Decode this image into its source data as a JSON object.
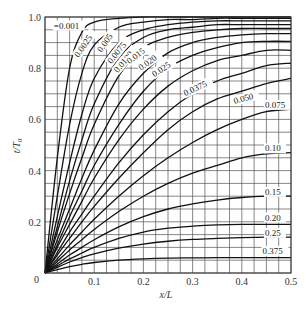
{
  "chart_data": {
    "type": "line",
    "title": "",
    "xlabel": "x/L",
    "ylabel": "t/T0",
    "xlim": [
      0,
      0.5
    ],
    "ylim": [
      0,
      1.0
    ],
    "grid": true,
    "grid_x_step": 0.025,
    "grid_y_step": 0.05,
    "x_ticks": [
      "0.1",
      "0.2",
      "0.3",
      "0.4",
      "0.5"
    ],
    "y_ticks": [
      "0",
      "0.2",
      "0.4",
      "0.6",
      "0.8",
      "1.0"
    ],
    "x": [
      0,
      0.025,
      0.05,
      0.075,
      0.1,
      0.15,
      0.2,
      0.25,
      0.3,
      0.35,
      0.4,
      0.45,
      0.5
    ],
    "series": [
      {
        "name": "0.001",
        "values": [
          0,
          0.45,
          0.8,
          0.94,
          0.98,
          0.995,
          1.0,
          1.0,
          1.0,
          1.0,
          1.0,
          1.0,
          1.0
        ]
      },
      {
        "name": "0.0025",
        "values": [
          0,
          0.3,
          0.58,
          0.78,
          0.89,
          0.96,
          0.98,
          0.99,
          0.99,
          0.995,
          0.995,
          0.995,
          0.995
        ]
      },
      {
        "name": "0.005",
        "values": [
          0,
          0.22,
          0.43,
          0.62,
          0.76,
          0.9,
          0.95,
          0.97,
          0.98,
          0.985,
          0.985,
          0.985,
          0.985
        ]
      },
      {
        "name": "0.0075",
        "values": [
          0,
          0.18,
          0.36,
          0.52,
          0.66,
          0.84,
          0.92,
          0.95,
          0.96,
          0.97,
          0.97,
          0.97,
          0.97
        ]
      },
      {
        "name": "0.0100",
        "values": [
          0,
          0.16,
          0.31,
          0.45,
          0.58,
          0.77,
          0.88,
          0.92,
          0.94,
          0.95,
          0.955,
          0.955,
          0.955
        ]
      },
      {
        "name": "0.015",
        "values": [
          0,
          0.13,
          0.25,
          0.37,
          0.48,
          0.66,
          0.78,
          0.86,
          0.9,
          0.92,
          0.93,
          0.935,
          0.935
        ]
      },
      {
        "name": "0.020",
        "values": [
          0,
          0.11,
          0.22,
          0.32,
          0.42,
          0.58,
          0.71,
          0.8,
          0.85,
          0.88,
          0.9,
          0.905,
          0.905
        ]
      },
      {
        "name": "0.025",
        "values": [
          0,
          0.1,
          0.19,
          0.28,
          0.37,
          0.52,
          0.64,
          0.73,
          0.79,
          0.83,
          0.85,
          0.87,
          0.87
        ]
      },
      {
        "name": "0.0375",
        "values": [
          0,
          0.08,
          0.16,
          0.23,
          0.3,
          0.43,
          0.54,
          0.63,
          0.7,
          0.75,
          0.78,
          0.81,
          0.82
        ]
      },
      {
        "name": "0.050",
        "values": [
          0,
          0.07,
          0.135,
          0.2,
          0.26,
          0.37,
          0.47,
          0.56,
          0.63,
          0.68,
          0.71,
          0.74,
          0.76
        ]
      },
      {
        "name": "0.075",
        "values": [
          0,
          0.055,
          0.11,
          0.16,
          0.21,
          0.3,
          0.38,
          0.45,
          0.51,
          0.56,
          0.6,
          0.63,
          0.64
        ]
      },
      {
        "name": "0.10",
        "values": [
          0,
          0.045,
          0.09,
          0.13,
          0.17,
          0.24,
          0.3,
          0.35,
          0.39,
          0.42,
          0.45,
          0.465,
          0.47
        ]
      },
      {
        "name": "0.15",
        "values": [
          0,
          0.035,
          0.07,
          0.1,
          0.13,
          0.18,
          0.22,
          0.25,
          0.27,
          0.285,
          0.295,
          0.3,
          0.3
        ]
      },
      {
        "name": "0.20",
        "values": [
          0,
          0.028,
          0.055,
          0.078,
          0.1,
          0.135,
          0.16,
          0.175,
          0.183,
          0.188,
          0.19,
          0.19,
          0.19
        ]
      },
      {
        "name": "0.25",
        "values": [
          0,
          0.022,
          0.043,
          0.06,
          0.075,
          0.097,
          0.113,
          0.124,
          0.131,
          0.135,
          0.138,
          0.14,
          0.14
        ]
      },
      {
        "name": "0.375",
        "values": [
          0,
          0.013,
          0.025,
          0.034,
          0.041,
          0.05,
          0.055,
          0.058,
          0.059,
          0.06,
          0.06,
          0.06,
          0.06
        ]
      }
    ],
    "curve_labels": [
      {
        "text": "=0.001",
        "x": 0.018,
        "y": 0.955,
        "rot": 0
      },
      {
        "text": "0.0025",
        "x": 0.068,
        "y": 0.84,
        "rot": -55
      },
      {
        "text": "0.005",
        "x": 0.115,
        "y": 0.86,
        "rot": -55
      },
      {
        "text": "0.0075",
        "x": 0.135,
        "y": 0.815,
        "rot": -52
      },
      {
        "text": "0.0100",
        "x": 0.148,
        "y": 0.78,
        "rot": -50
      },
      {
        "text": "0.015",
        "x": 0.172,
        "y": 0.815,
        "rot": -38
      },
      {
        "text": "0.020",
        "x": 0.195,
        "y": 0.79,
        "rot": -35
      },
      {
        "text": "0.025",
        "x": 0.222,
        "y": 0.765,
        "rot": -32
      },
      {
        "text": "0.0375",
        "x": 0.285,
        "y": 0.69,
        "rot": -25
      },
      {
        "text": "0.050",
        "x": 0.385,
        "y": 0.66,
        "rot": -15
      },
      {
        "text": "0.075",
        "x": 0.447,
        "y": 0.645,
        "rot": 0
      },
      {
        "text": "0.10",
        "x": 0.447,
        "y": 0.475,
        "rot": 0
      },
      {
        "text": "0.15",
        "x": 0.447,
        "y": 0.305,
        "rot": 0
      },
      {
        "text": "0.20",
        "x": 0.447,
        "y": 0.205,
        "rot": 0
      },
      {
        "text": "0.25",
        "x": 0.447,
        "y": 0.145,
        "rot": 0
      },
      {
        "text": "0.375",
        "x": 0.442,
        "y": 0.075,
        "rot": 0
      }
    ]
  },
  "axes": {
    "x_label": "x/L",
    "y_label_main": "t/T",
    "y_label_sub": "0",
    "origin_label": "0"
  }
}
